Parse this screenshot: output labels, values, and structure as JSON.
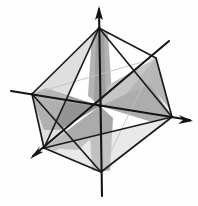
{
  "figure": {
    "background_color": "#fefefe",
    "line_color": "#1a1a1a",
    "faint_line_color": "#b9b9b9",
    "width": 198,
    "height": 206
  },
  "palette": {
    "ink": "#1d1d1d",
    "ink_soft": "#3a3a3a",
    "faint": "#c2c2c2",
    "plane_dark": "#8d8d8d",
    "plane_mid": "#a5a5a5",
    "plane_light": "#bdbdbd",
    "plane_pale": "#d2d2d2",
    "paper": "#fefefe"
  },
  "geometry": {
    "center": {
      "x": 100,
      "y": 106
    },
    "vertices": {
      "top": {
        "x": 99,
        "y": 28,
        "name": "top-vertex"
      },
      "bottom": {
        "x": 101,
        "y": 172,
        "name": "bottom-vertex"
      },
      "left": {
        "x": 32,
        "y": 94,
        "name": "left-vertex"
      },
      "right": {
        "x": 172,
        "y": 117,
        "name": "right-vertex"
      },
      "near": {
        "x": 44,
        "y": 148,
        "name": "near-vertex"
      },
      "far": {
        "x": 156,
        "y": 58,
        "name": "far-vertex"
      }
    },
    "axis_tips": {
      "vertical_up": {
        "x": 99,
        "y": 8
      },
      "vertical_down": {
        "x": 102,
        "y": 196
      },
      "horizontal_left": {
        "x": 11,
        "y": 91
      },
      "horizontal_right": {
        "x": 190,
        "y": 120
      },
      "diagonal_far": {
        "x": 169,
        "y": 41
      },
      "diagonal_near": {
        "x": 32,
        "y": 157
      }
    }
  },
  "axes": [
    {
      "id": "vertical-axis",
      "label": "vertical axis",
      "arrow_ends": [
        "up"
      ]
    },
    {
      "id": "horizontal-axis",
      "label": "horizontal axis",
      "arrow_ends": [
        "right"
      ]
    },
    {
      "id": "diagonal-axis",
      "label": "depth axis",
      "arrow_ends": [
        "near"
      ]
    }
  ],
  "planes": [
    {
      "id": "vertical-plane",
      "label": "vertical cross-section plane",
      "shade": "#a8a8a8"
    },
    {
      "id": "horizontal-plane",
      "label": "horizontal cross-section plane",
      "shade": "#9b9b9b"
    },
    {
      "id": "diagonal-plane",
      "label": "diagonal cross-section plane",
      "shade": "#b5b5b5"
    }
  ],
  "edges": [
    {
      "id": "edge-top-left"
    },
    {
      "id": "edge-top-right"
    },
    {
      "id": "edge-top-near"
    },
    {
      "id": "edge-top-far"
    },
    {
      "id": "edge-bottom-left"
    },
    {
      "id": "edge-bottom-right"
    },
    {
      "id": "edge-bottom-near"
    },
    {
      "id": "edge-bottom-far"
    },
    {
      "id": "edge-left-near"
    },
    {
      "id": "edge-near-right"
    },
    {
      "id": "edge-right-far"
    },
    {
      "id": "edge-far-left"
    }
  ],
  "annotations": {
    "visible_text": ""
  }
}
